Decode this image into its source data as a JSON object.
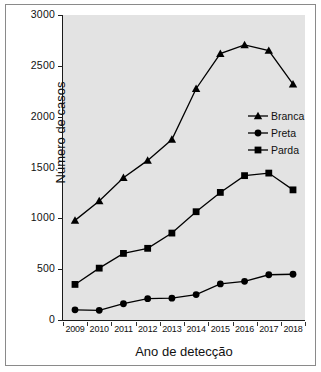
{
  "chart_data": {
    "type": "line",
    "title": "",
    "xlabel": "Ano de detecção",
    "ylabel": "Número de casos",
    "categories": [
      "2009",
      "2010",
      "2011",
      "2012",
      "2013",
      "2014",
      "2015",
      "2016",
      "2017",
      "2018"
    ],
    "x": [
      2009,
      2010,
      2011,
      2012,
      2013,
      2014,
      2015,
      2016,
      2017,
      2018
    ],
    "ylim": [
      0,
      3000
    ],
    "yticks": [
      0,
      500,
      1000,
      1500,
      2000,
      2500,
      3000
    ],
    "ytick_labels": [
      "0",
      "500",
      "1000",
      "1500",
      "2000",
      "2500",
      "3000"
    ],
    "grid": false,
    "legend_position": "center-right",
    "series": [
      {
        "name": "Branca",
        "marker": "triangle",
        "color": "#000000",
        "values": [
          980,
          1170,
          1400,
          1570,
          1775,
          2275,
          2620,
          2705,
          2650,
          2320
        ]
      },
      {
        "name": "Preta",
        "marker": "circle",
        "color": "#000000",
        "values": [
          100,
          95,
          160,
          210,
          215,
          250,
          355,
          380,
          445,
          450
        ]
      },
      {
        "name": "Parda",
        "marker": "square",
        "color": "#000000",
        "values": [
          350,
          510,
          655,
          705,
          855,
          1065,
          1255,
          1420,
          1445,
          1280
        ]
      }
    ]
  },
  "axes": {
    "x_title": "Ano de detecção",
    "y_title": "Número de casos"
  },
  "legend": {
    "items": [
      {
        "label": "Branca",
        "marker": "triangle"
      },
      {
        "label": "Preta",
        "marker": "circle"
      },
      {
        "label": "Parda",
        "marker": "square"
      }
    ]
  },
  "style": {
    "plot_background": "#e3e3e3",
    "figure_background": "#ffffff",
    "line_color": "#000000",
    "frame_color": "#8a8a8a"
  }
}
